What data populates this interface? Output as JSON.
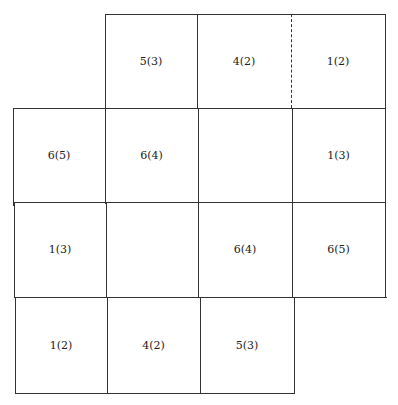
{
  "diagram": {
    "type": "grid-net",
    "cells": [
      {
        "row": 0,
        "col": 1,
        "label": "5(3)"
      },
      {
        "row": 0,
        "col": 2,
        "label": "4(2)"
      },
      {
        "row": 0,
        "col": 3,
        "label": "1(2)"
      },
      {
        "row": 1,
        "col": 0,
        "label": "6(5)"
      },
      {
        "row": 1,
        "col": 1,
        "label": "6(4)"
      },
      {
        "row": 1,
        "col": 2,
        "label": ""
      },
      {
        "row": 1,
        "col": 3,
        "label": "1(3)"
      },
      {
        "row": 2,
        "col": 0,
        "label": "1(3)"
      },
      {
        "row": 2,
        "col": 1,
        "label": ""
      },
      {
        "row": 2,
        "col": 2,
        "label": "6(4)"
      },
      {
        "row": 2,
        "col": 3,
        "label": "6(5)"
      },
      {
        "row": 3,
        "col": 0,
        "label": "1(2)"
      },
      {
        "row": 3,
        "col": 1,
        "label": "4(2)"
      },
      {
        "row": 3,
        "col": 2,
        "label": "5(3)"
      }
    ],
    "dashed_edge": "between row 0 col 2 and row 0 col 3",
    "line_color": "#333333",
    "background": "#ffffff"
  }
}
